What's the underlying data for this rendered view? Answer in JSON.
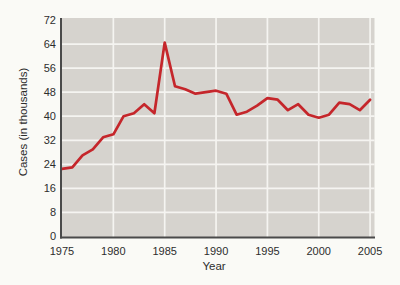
{
  "chart_data": {
    "type": "line",
    "title": "",
    "xlabel": "Year",
    "ylabel": "Cases (in thousands)",
    "series_name": "Reported cases (in thousands)",
    "x": [
      1975,
      1976,
      1977,
      1978,
      1979,
      1980,
      1981,
      1982,
      1983,
      1984,
      1985,
      1986,
      1987,
      1988,
      1989,
      1990,
      1991,
      1992,
      1993,
      1994,
      1995,
      1996,
      1997,
      1998,
      1999,
      2000,
      2001,
      2002,
      2003,
      2004,
      2005
    ],
    "values": [
      22.5,
      23,
      27,
      29,
      33,
      34,
      40,
      41,
      44,
      41,
      64.5,
      50,
      49,
      47.5,
      48,
      48.5,
      47.5,
      40.5,
      41.5,
      43.5,
      46,
      45.5,
      42,
      44,
      40.5,
      39.5,
      40.5,
      44.5,
      44,
      42,
      45.5
    ],
    "xlim": [
      1975,
      2005
    ],
    "ylim": [
      0,
      72
    ],
    "x_ticks": [
      1975,
      1980,
      1985,
      1990,
      1995,
      2000,
      2005
    ],
    "y_ticks": [
      0,
      8,
      16,
      24,
      32,
      40,
      48,
      56,
      64,
      72
    ],
    "grid": true,
    "legend": "none",
    "colors": {
      "line": "#c5262b",
      "plot_bg": "#d6d3ce",
      "grid": "#f5f4f1",
      "axis": "#4a4a4a",
      "text": "#2d2d2d",
      "page_bg": "#fafaf6"
    }
  }
}
